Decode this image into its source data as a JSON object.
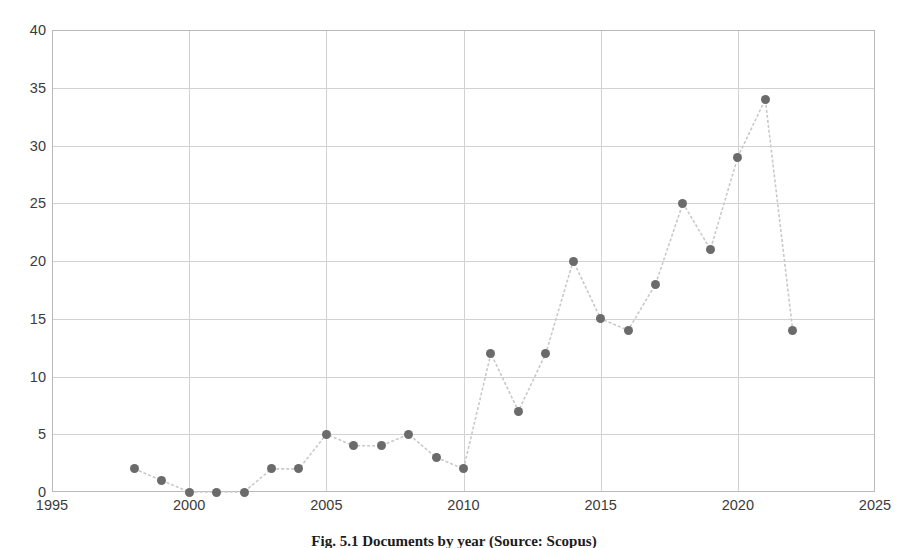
{
  "figure": {
    "caption": "Fig. 5.1 Documents by year (Source: Scopus)"
  },
  "chart_data": {
    "type": "line",
    "title": "",
    "xlabel": "",
    "ylabel": "",
    "xlim": [
      1995,
      2025
    ],
    "ylim": [
      0,
      40
    ],
    "grid": true,
    "legend": false,
    "marker": "circle",
    "marker_color": "#6b6b6b",
    "line_color": "#c9c9c9",
    "line_style": "dashed",
    "xticks": [
      1995,
      2000,
      2005,
      2010,
      2015,
      2020,
      2025
    ],
    "xtick_labels": [
      "1995",
      "2000",
      "2005",
      "2010",
      "2015",
      "2020",
      "2025"
    ],
    "yticks": [
      0,
      5,
      10,
      15,
      20,
      25,
      30,
      35,
      40
    ],
    "ytick_labels": [
      "0",
      "5",
      "10",
      "15",
      "20",
      "25",
      "30",
      "35",
      "40"
    ],
    "x": [
      1998,
      1999,
      2000,
      2001,
      2002,
      2003,
      2004,
      2005,
      2006,
      2007,
      2008,
      2009,
      2010,
      2011,
      2012,
      2013,
      2014,
      2015,
      2016,
      2017,
      2018,
      2019,
      2020,
      2021,
      2022
    ],
    "values": [
      2,
      1,
      0,
      0,
      0,
      2,
      2,
      5,
      4,
      4,
      5,
      3,
      2,
      12,
      7,
      12,
      20,
      15,
      14,
      18,
      25,
      21,
      29,
      34,
      14
    ]
  }
}
